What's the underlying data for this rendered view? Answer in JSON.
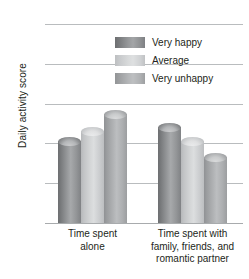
{
  "chart_data": {
    "type": "bar",
    "title": "",
    "xlabel": "",
    "ylabel": "Daily activity score",
    "ylim": [
      0,
      10
    ],
    "yticks": [
      0,
      2,
      4,
      6,
      8,
      10
    ],
    "grid": true,
    "legend_position": "inside upper-right",
    "categories": [
      "Time spent alone",
      "Time spent with family, friends, and romantic partner"
    ],
    "category_lines": [
      [
        "Time spent",
        "alone"
      ],
      [
        "Time spent with",
        "family, friends, and",
        "romantic partner"
      ]
    ],
    "series": [
      {
        "name": "Very happy",
        "color": "#8d8f91",
        "values": [
          4.3,
          5.05
        ]
      },
      {
        "name": "Average",
        "color": "#cdcfd1",
        "values": [
          4.8,
          4.3
        ]
      },
      {
        "name": "Very unhappy",
        "color": "#aeb0b2",
        "values": [
          5.7,
          3.5
        ]
      }
    ]
  },
  "axis": {
    "y_title": "Daily activity score",
    "y_tick_labels": [
      "10",
      "8",
      "6",
      "4",
      "2",
      "0"
    ]
  },
  "legend": {
    "items": [
      {
        "label": "Very happy"
      },
      {
        "label": "Average"
      },
      {
        "label": "Very unhappy"
      }
    ]
  },
  "colors": {
    "gridline": "#b9bcbe",
    "text": "#231f20",
    "series_dark": "#8d8f91",
    "series_light": "#cdcfd1",
    "series_mid": "#aeb0b2"
  }
}
